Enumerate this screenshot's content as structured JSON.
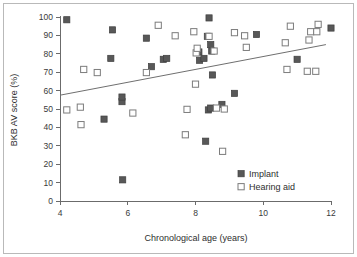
{
  "chart_data": {
    "type": "scatter",
    "title": "",
    "xlabel": "Chronological age (years)",
    "ylabel": "BKB AV score (%)",
    "xlim": [
      4,
      12
    ],
    "ylim": [
      0,
      100
    ],
    "xticks": [
      4,
      6,
      8,
      10,
      12
    ],
    "yticks": [
      0,
      10,
      20,
      30,
      40,
      50,
      60,
      70,
      80,
      90,
      100
    ],
    "xtick_labels": [
      "4",
      "6",
      "8",
      "10",
      "12"
    ],
    "ytick_labels": [
      "0",
      "10",
      "20",
      "30",
      "40",
      "50",
      "60",
      "70",
      "80",
      "90",
      "100"
    ],
    "grid": false,
    "legend_position": "lower-right",
    "series": [
      {
        "name": "Implant",
        "marker": "filled-square",
        "color": "#585858",
        "points": [
          [
            4.2,
            98.5
          ],
          [
            5.3,
            44.5
          ],
          [
            5.5,
            77.5
          ],
          [
            5.55,
            93.0
          ],
          [
            5.85,
            11.5
          ],
          [
            5.83,
            54.0
          ],
          [
            5.83,
            56.5
          ],
          [
            6.55,
            88.5
          ],
          [
            6.7,
            73.0
          ],
          [
            7.05,
            77.0
          ],
          [
            7.15,
            77.5
          ],
          [
            8.1,
            81.0
          ],
          [
            8.12,
            76.5
          ],
          [
            8.25,
            77.5
          ],
          [
            8.3,
            32.5
          ],
          [
            8.35,
            89.5
          ],
          [
            8.4,
            99.5
          ],
          [
            8.45,
            85.0
          ],
          [
            8.48,
            81.5
          ],
          [
            8.5,
            68.5
          ],
          [
            8.38,
            49.5
          ],
          [
            8.45,
            50.5
          ],
          [
            8.78,
            52.5
          ],
          [
            9.15,
            58.5
          ],
          [
            9.8,
            90.5
          ],
          [
            11.0,
            77.0
          ],
          [
            12.0,
            94.0
          ]
        ]
      },
      {
        "name": "Hearing aid",
        "marker": "open-square",
        "color": "#ffffff",
        "points": [
          [
            4.2,
            49.5
          ],
          [
            4.6,
            51.0
          ],
          [
            4.62,
            41.5
          ],
          [
            4.7,
            71.5
          ],
          [
            5.1,
            69.8
          ],
          [
            6.15,
            47.8
          ],
          [
            6.55,
            69.8
          ],
          [
            6.9,
            95.5
          ],
          [
            7.4,
            89.8
          ],
          [
            7.7,
            36.0
          ],
          [
            7.75,
            49.8
          ],
          [
            7.95,
            92.0
          ],
          [
            8.0,
            63.5
          ],
          [
            8.02,
            80.5
          ],
          [
            8.05,
            83.0
          ],
          [
            8.4,
            89.5
          ],
          [
            8.55,
            81.5
          ],
          [
            8.62,
            50.5
          ],
          [
            8.8,
            27.0
          ],
          [
            8.85,
            50.0
          ],
          [
            9.15,
            91.5
          ],
          [
            9.45,
            89.8
          ],
          [
            9.5,
            83.5
          ],
          [
            10.65,
            86.0
          ],
          [
            10.7,
            71.5
          ],
          [
            10.8,
            95.0
          ],
          [
            11.3,
            70.5
          ],
          [
            11.35,
            87.5
          ],
          [
            11.4,
            92.0
          ],
          [
            11.55,
            70.5
          ],
          [
            11.58,
            92.0
          ],
          [
            11.62,
            96.0
          ]
        ]
      }
    ],
    "trend_line": {
      "x_start": 4.0,
      "y_start": 57.5,
      "x_end": 11.85,
      "y_end": 85.0
    }
  },
  "legend": {
    "items": [
      {
        "label": "Implant",
        "marker": "filled-square"
      },
      {
        "label": "Hearing aid",
        "marker": "open-square"
      }
    ]
  }
}
